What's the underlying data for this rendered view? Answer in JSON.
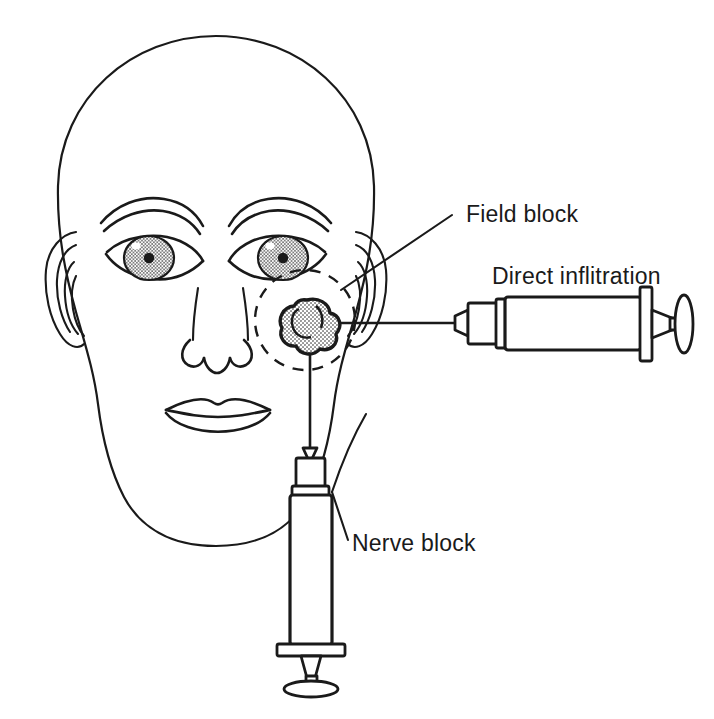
{
  "figure": {
    "background_color": "#ffffff",
    "line_color": "#1a1a1a",
    "stipple_color": "#9a9a9a"
  },
  "annotations": [
    {
      "id": "field-block",
      "label": "Field block",
      "label_x": 466,
      "label_y": 222,
      "leader": "from label down-left to the dashed circle perimeter",
      "technique": "ring of infiltration surrounding the lesion"
    },
    {
      "id": "direct-infiltration",
      "label": "Direct inflitration",
      "label_x": 492,
      "label_y": 284,
      "leader": "horizontal syringe on the right, needle entering the lesion",
      "technique": "anaesthetic deposited directly into the lesion"
    },
    {
      "id": "nerve-block",
      "label": "Nerve block",
      "label_x": 352,
      "label_y": 551,
      "leader": "from label up-left to the vertical syringe hub",
      "technique": "anaesthetic deposited around the supplying nerve"
    }
  ],
  "lesion": {
    "name": "lesion",
    "description": "stippled lobed cheek lesion marking the injection target",
    "center_x": 307,
    "center_y": 322,
    "radius": 22
  },
  "field_block_circle": {
    "name": "field-block-dashed-circle",
    "center_x": 305,
    "center_y": 320,
    "radius": 50,
    "style": "dashed"
  },
  "syringes": [
    {
      "id": "horizontal-syringe",
      "orientation": "horizontal",
      "points_to": "lesion",
      "parts": [
        "needle",
        "hub",
        "barrel",
        "flange",
        "plunger-rod",
        "thumb-rest"
      ]
    },
    {
      "id": "vertical-syringe",
      "orientation": "vertical",
      "points_to": "lesion",
      "parts": [
        "needle",
        "hub",
        "barrel",
        "flange",
        "plunger-rod",
        "thumb-rest"
      ]
    }
  ],
  "face_features": [
    {
      "name": "cranium-outline"
    },
    {
      "name": "left-ear"
    },
    {
      "name": "right-ear"
    },
    {
      "name": "left-eyebrow"
    },
    {
      "name": "right-eyebrow"
    },
    {
      "name": "left-eye"
    },
    {
      "name": "right-eye"
    },
    {
      "name": "nose"
    },
    {
      "name": "mouth"
    },
    {
      "name": "left-nasolabial-fold"
    },
    {
      "name": "right-nasolabial-fold"
    }
  ]
}
